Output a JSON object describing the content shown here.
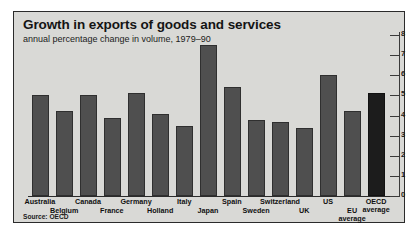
{
  "chart_data": {
    "type": "bar",
    "title": "Growth in exports of goods and services",
    "subtitle": "annual percentage change in volume, 1979–90",
    "source": "Source: OECD",
    "xlabel": "",
    "ylabel": "",
    "ylim": [
      0,
      8
    ],
    "yticks": [
      "0",
      "1",
      "2",
      "3",
      "4",
      "5",
      "6",
      "7",
      "8"
    ],
    "grid": false,
    "legend": "none",
    "axis_position": "right",
    "categories": [
      "Australia",
      "Belgium",
      "Canada",
      "France",
      "Germany",
      "Holland",
      "Italy",
      "Japan",
      "Spain",
      "Sweden",
      "Switzerland",
      "UK",
      "US",
      "EU average",
      "OECD average"
    ],
    "values": [
      5.0,
      4.2,
      5.0,
      3.9,
      5.1,
      4.1,
      3.5,
      7.5,
      5.4,
      3.8,
      3.7,
      3.4,
      6.0,
      4.2,
      5.1
    ],
    "highlight_index": 14,
    "colors": {
      "bar": "#4f4f4f",
      "bar_highlight": "#1c1c1c",
      "panel_background": "#d9d9d6",
      "text": "#141414",
      "axis": "#2b2b2b"
    }
  }
}
